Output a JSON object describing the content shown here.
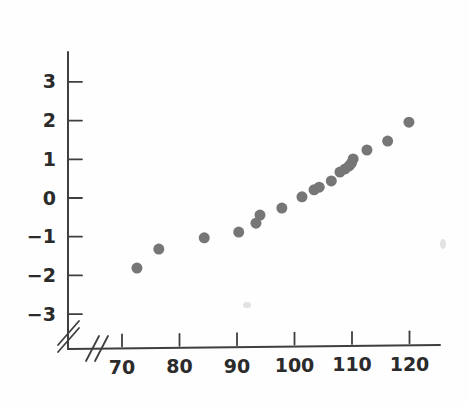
{
  "chart_data": {
    "type": "scatter",
    "title": "",
    "subtitle": "",
    "xlabel": "",
    "ylabel": "",
    "xlim": [
      64,
      126
    ],
    "ylim": [
      -3.6,
      3.6
    ],
    "grid": false,
    "legend": null,
    "axis_break_x": true,
    "axis_break_y": true,
    "marker": {
      "shape": "circle",
      "color": "#767676",
      "size_px": 11
    },
    "x_ticks": [
      70,
      80,
      90,
      100,
      110,
      120
    ],
    "x_tick_labels": [
      "70",
      "80",
      "90",
      "100",
      "110",
      "120"
    ],
    "y_ticks": [
      -3,
      -2,
      -1,
      0,
      1,
      2,
      3
    ],
    "y_tick_labels": [
      "−3",
      "−2",
      "−1",
      "0",
      "1",
      "2",
      "3"
    ],
    "points": [
      {
        "x": 72.6,
        "y": -1.81
      },
      {
        "x": 76.4,
        "y": -1.32
      },
      {
        "x": 84.3,
        "y": -1.03
      },
      {
        "x": 90.3,
        "y": -0.88
      },
      {
        "x": 93.3,
        "y": -0.65
      },
      {
        "x": 94.0,
        "y": -0.44
      },
      {
        "x": 97.8,
        "y": -0.26
      },
      {
        "x": 101.3,
        "y": 0.03
      },
      {
        "x": 103.4,
        "y": 0.21
      },
      {
        "x": 104.3,
        "y": 0.28
      },
      {
        "x": 106.4,
        "y": 0.44
      },
      {
        "x": 107.9,
        "y": 0.67
      },
      {
        "x": 108.8,
        "y": 0.75
      },
      {
        "x": 109.5,
        "y": 0.83
      },
      {
        "x": 109.9,
        "y": 0.9
      },
      {
        "x": 110.2,
        "y": 1.01
      },
      {
        "x": 112.6,
        "y": 1.24
      },
      {
        "x": 116.2,
        "y": 1.47
      },
      {
        "x": 119.9,
        "y": 1.96
      }
    ]
  },
  "axes": {
    "y_axis_name": "y-axis",
    "x_axis_name": "x-axis",
    "break_symbol": "//"
  }
}
